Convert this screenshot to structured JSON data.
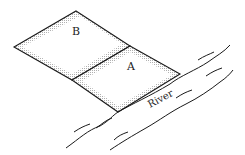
{
  "diagram": {
    "title": "",
    "plots": [
      {
        "id": "B",
        "label": "B"
      },
      {
        "id": "A",
        "label": "A"
      }
    ],
    "river": {
      "label": "River"
    },
    "colors": {
      "stroke": "#1a1a1a",
      "stipple": "#b8b8b8",
      "background": "#ffffff"
    }
  }
}
